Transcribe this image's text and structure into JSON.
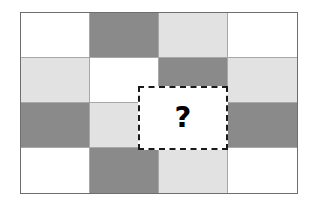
{
  "figure": {
    "query_symbol": "?",
    "query_label": "missing-region",
    "palette": {
      "white": "#ffffff",
      "light_gray": "#e2e2e2",
      "dark_gray": "#8a8a8a",
      "grid_line": "#a8a8a8",
      "frame_line": "#6e6e6e",
      "dash_line": "#1a1a1a"
    },
    "grid": {
      "rows": 4,
      "columns": 4,
      "cells": [
        {
          "row": 1,
          "col": 1,
          "shade": "white"
        },
        {
          "row": 1,
          "col": 2,
          "shade": "dark_gray"
        },
        {
          "row": 1,
          "col": 3,
          "shade": "light_gray"
        },
        {
          "row": 1,
          "col": 4,
          "shade": "white"
        },
        {
          "row": 2,
          "col": 1,
          "shade": "light_gray"
        },
        {
          "row": 2,
          "col": 2,
          "shade": "white"
        },
        {
          "row": 2,
          "col": 3,
          "shade": "dark_gray"
        },
        {
          "row": 2,
          "col": 4,
          "shade": "light_gray"
        },
        {
          "row": 3,
          "col": 1,
          "shade": "dark_gray"
        },
        {
          "row": 3,
          "col": 2,
          "shade": "light_gray"
        },
        {
          "row": 3,
          "col": 3,
          "shade": "white"
        },
        {
          "row": 3,
          "col": 4,
          "shade": "dark_gray"
        },
        {
          "row": 4,
          "col": 1,
          "shade": "white"
        },
        {
          "row": 4,
          "col": 2,
          "shade": "dark_gray"
        },
        {
          "row": 4,
          "col": 3,
          "shade": "light_gray"
        },
        {
          "row": 4,
          "col": 4,
          "shade": "white"
        }
      ]
    }
  }
}
